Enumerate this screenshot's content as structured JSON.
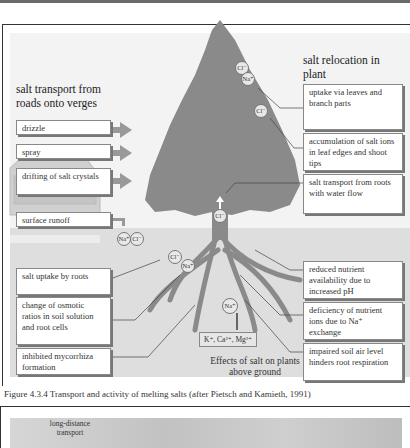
{
  "figure": {
    "left_heading": "salt transport from roads onto verges",
    "right_heading": "salt relocation in plant",
    "left_boxes": [
      {
        "label": "drizzle"
      },
      {
        "label": "spray"
      },
      {
        "label": "drifting of salt crystals"
      },
      {
        "label": "surface runoff"
      }
    ],
    "soil_left_boxes": [
      {
        "label": "salt uptake by roots"
      },
      {
        "label": "change of osmotic ratios in soil solution and root cells"
      },
      {
        "label": "inhibited mycorrhiza formation"
      }
    ],
    "right_boxes": [
      {
        "label": "uptake via leaves and branch parts"
      },
      {
        "label": "accumulation of salt ions in leaf edges and shoot tips"
      },
      {
        "label": "salt transport from roots with water flow"
      }
    ],
    "soil_right_boxes": [
      {
        "label": "reduced nutrient availability due to increased pH"
      },
      {
        "label": "deficiency of nutrient ions due to Na⁺ exchange"
      },
      {
        "label": "impaired soil air level hinders root respiration"
      }
    ],
    "ions": {
      "cl": "Cl⁻",
      "na": "Na⁺",
      "nutrients": "K⁺, Ca²⁺, Mg²⁺"
    },
    "effects_label": "Effects of salt on plants above ground",
    "caption": "Figure 4.3.4 Transport and activity of melting salts (after Pietsch and Kamieth, 1991)"
  },
  "next_figure": {
    "label": "long-distance transport"
  }
}
